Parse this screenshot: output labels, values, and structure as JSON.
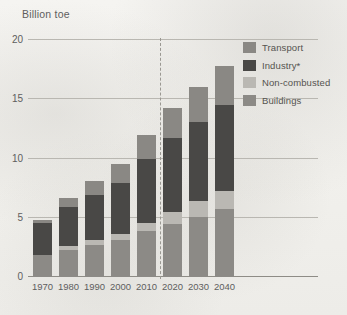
{
  "chart_data": {
    "type": "bar",
    "subtype": "stacked-bar",
    "title": "Billion toe",
    "xlabel": "",
    "ylabel": "Billion toe",
    "ylim": [
      0,
      20
    ],
    "yticks": [
      0,
      5,
      10,
      15,
      20
    ],
    "ytick_labels": [
      "0",
      "5",
      "10",
      "15",
      "20"
    ],
    "grid": true,
    "legend_position": "top-right",
    "categories": [
      "1970",
      "1980",
      "1990",
      "2000",
      "2010",
      "2020",
      "2030",
      "2040"
    ],
    "series": [
      {
        "name": "Buildings",
        "color": "#8c8a86",
        "values": [
          1.9,
          2.3,
          2.7,
          3.1,
          3.9,
          4.5,
          5.1,
          5.7
        ]
      },
      {
        "name": "Non-combusted",
        "color": "#bab8b3",
        "values": [
          0.0,
          0.3,
          0.4,
          0.5,
          0.7,
          1.0,
          1.3,
          1.6
        ]
      },
      {
        "name": "Industry*",
        "color": "#494846",
        "values": [
          2.7,
          3.3,
          3.8,
          4.3,
          5.4,
          6.2,
          6.7,
          7.2
        ]
      },
      {
        "name": "Transport",
        "color": "#8a8884",
        "values": [
          0.2,
          0.8,
          1.2,
          1.6,
          2.0,
          2.6,
          2.9,
          3.3
        ]
      }
    ],
    "totals": [
      4.8,
      6.7,
      8.1,
      9.5,
      12.0,
      14.3,
      16.0,
      17.8
    ],
    "legend_order": [
      "Transport",
      "Industry*",
      "Non-combusted",
      "Buildings"
    ],
    "stack_order_bottom_to_top": [
      "Buildings",
      "Non-combusted",
      "Industry*",
      "Transport"
    ],
    "annotations": [
      {
        "name": "forecast-divider",
        "type": "vertical-dashed-line",
        "between": [
          "2010",
          "2020"
        ],
        "meaning": "history / projection boundary"
      }
    ]
  },
  "legend": {
    "items": [
      {
        "label": "Transport",
        "color": "#8a8884"
      },
      {
        "label": "Industry*",
        "color": "#494846"
      },
      {
        "label": "Non-combusted",
        "color": "#bab8b3"
      },
      {
        "label": "Buildings",
        "color": "#8c8a86"
      }
    ]
  }
}
